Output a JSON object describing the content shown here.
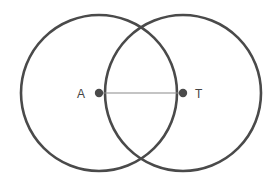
{
  "diagram": {
    "colors": {
      "stroke": "#4a4a4a",
      "segment": "#8a8a8a",
      "background": "#ffffff"
    },
    "points": [
      {
        "id": "A",
        "label": "A",
        "x": 99,
        "y": 93
      },
      {
        "id": "T",
        "label": "T",
        "x": 183,
        "y": 93
      }
    ],
    "circles": [
      {
        "id": "circle-A",
        "center": "A",
        "cx": 99,
        "cy": 93,
        "r": 78
      },
      {
        "id": "circle-T",
        "center": "T",
        "cx": 183,
        "cy": 93,
        "r": 78
      }
    ],
    "segments": [
      {
        "id": "segment-AT",
        "from": "A",
        "to": "T"
      }
    ],
    "labels": {
      "A": "A",
      "T": "T"
    }
  }
}
